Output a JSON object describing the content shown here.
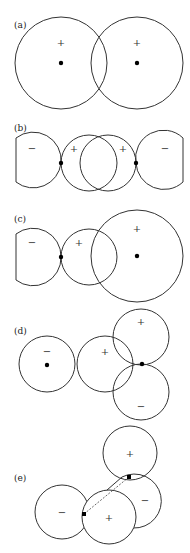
{
  "panels": {
    "a": {
      "label": "(a)",
      "signs": [
        "+",
        "+"
      ]
    },
    "b": {
      "label": "(b)",
      "signs": [
        "−",
        "+",
        "+",
        "−"
      ]
    },
    "c": {
      "label": "(c)",
      "signs": [
        "−",
        "+",
        "+"
      ]
    },
    "d": {
      "label": "(d)",
      "signs": [
        "−",
        "+",
        "+",
        "−"
      ]
    },
    "e": {
      "label": "(e)",
      "signs": [
        "+",
        "−",
        "−",
        "+"
      ]
    }
  }
}
